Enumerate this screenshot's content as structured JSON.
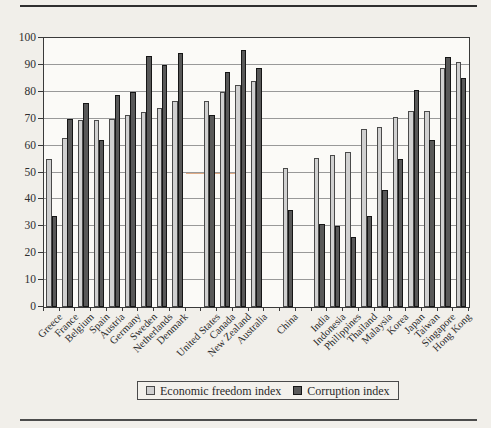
{
  "page": {
    "background": "#f1efea",
    "top_rule_color": "#2f2f2f",
    "bottom_rule_color": "#4c4c4c"
  },
  "chart_data": {
    "type": "bar",
    "title": "",
    "xlabel": "",
    "ylabel": "",
    "categories": [
      "Greece",
      "France",
      "Belgium",
      "Spain",
      "Austria",
      "Germany",
      "Sweden",
      "Netherlands",
      "Denmark",
      "United States",
      "Canada",
      "New Zealand",
      "Australia",
      "China",
      "India",
      "Indonesia",
      "Philippines",
      "Thailand",
      "Malaysia",
      "Korea",
      "Japan",
      "Taiwan",
      "Singapore",
      "Hong Kong"
    ],
    "slot_layout": [
      "Greece",
      "France",
      "Belgium",
      "Spain",
      "Austria",
      "Germany",
      "Sweden",
      "Netherlands",
      "Denmark",
      "",
      "United States",
      "Canada",
      "New Zealand",
      "Australia",
      "",
      "China",
      "",
      "India",
      "Indonesia",
      "Philippines",
      "Thailand",
      "Malaysia",
      "Korea",
      "Japan",
      "Taiwan",
      "Singapore",
      "Hong Kong"
    ],
    "series": [
      {
        "name": "Economic freedom index",
        "color": "#d0d0d0",
        "border_color": "#4a4a4a",
        "values": [
          55,
          63,
          69.5,
          69.5,
          70,
          71.5,
          72.5,
          74,
          76.5,
          76.5,
          80,
          82.5,
          84,
          51.5,
          55.5,
          56.5,
          57.5,
          66,
          67,
          70.5,
          73,
          73,
          89,
          91
        ]
      },
      {
        "name": "Corruption index",
        "color": "#585858",
        "border_color": "#161616",
        "values": [
          34,
          70,
          76,
          62,
          79,
          80,
          93.5,
          90,
          94.5,
          71.5,
          87.5,
          95.5,
          89,
          36,
          31,
          30,
          26,
          34,
          43.5,
          55,
          80.5,
          62,
          93,
          85
        ]
      }
    ],
    "ylim": [
      0,
      100
    ],
    "yticks": [
      0,
      10,
      20,
      30,
      40,
      50,
      60,
      70,
      80,
      90,
      100
    ],
    "grid": true,
    "gridline_color": "#999999",
    "axis_color": "#3a3a3a",
    "plot_background": "#fbfaf7",
    "legend_position": "bottom-center",
    "scan_artifact_color": "#cf7f48"
  }
}
